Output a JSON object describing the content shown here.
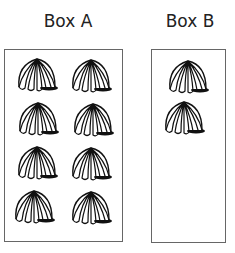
{
  "boxes": [
    {
      "label": "Box A",
      "count": 8
    },
    {
      "label": "Box B",
      "count": 2
    }
  ],
  "icon": "shell-icon"
}
